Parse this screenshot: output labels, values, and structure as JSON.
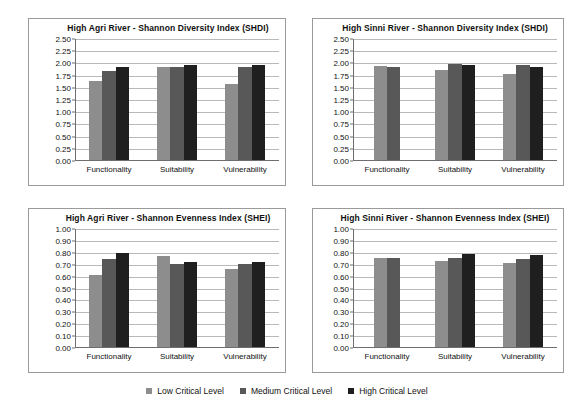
{
  "legend": {
    "items": [
      {
        "label": "Low Critical Level",
        "key": "low",
        "color": "#8d8d8d"
      },
      {
        "label": "Medium Critical Level",
        "key": "med",
        "color": "#585858"
      },
      {
        "label": "High Critical Level",
        "key": "high",
        "color": "#1f1f1f"
      }
    ]
  },
  "chart_data": [
    {
      "id": "agri-shdi",
      "type": "bar",
      "title": "High Agri River - Shannon Diversity Index (SHDI)",
      "xlabel": "",
      "ylabel": "",
      "ylim": [
        0,
        2.5
      ],
      "ytick_step": 0.25,
      "ytick_labels": [
        "0.00",
        "0.25",
        "0.50",
        "0.75",
        "1.00",
        "1.25",
        "1.50",
        "1.75",
        "2.00",
        "2.25",
        "2.50"
      ],
      "grid": true,
      "legend_position": "bottom-shared",
      "categories": [
        "Functionality",
        "Suitability",
        "Vulnerability"
      ],
      "series": [
        {
          "name": "Low Critical Level",
          "key": "low",
          "values": [
            1.64,
            1.92,
            1.58
          ]
        },
        {
          "name": "Medium Critical Level",
          "key": "med",
          "values": [
            1.84,
            1.92,
            1.92
          ]
        },
        {
          "name": "High Critical Level",
          "key": "high",
          "values": [
            1.92,
            1.97,
            1.97
          ]
        }
      ]
    },
    {
      "id": "sinni-shdi",
      "type": "bar",
      "title": "High Sinni River  -  Shannon Diversity Index (SHDI)",
      "xlabel": "",
      "ylabel": "",
      "ylim": [
        0,
        2.5
      ],
      "ytick_step": 0.25,
      "ytick_labels": [
        "0.00",
        "0.25",
        "0.50",
        "0.75",
        "1.00",
        "1.25",
        "1.50",
        "1.75",
        "2.00",
        "2.25",
        "2.50"
      ],
      "grid": true,
      "legend_position": "bottom-shared",
      "categories": [
        "Functionality",
        "Suitability",
        "Vulnerability"
      ],
      "series": [
        {
          "name": "Low Critical Level",
          "key": "low",
          "values": [
            1.95,
            1.87,
            1.78
          ]
        },
        {
          "name": "Medium Critical Level",
          "key": "med",
          "values": [
            1.93,
            1.99,
            1.97
          ]
        },
        {
          "name": "High Critical Level",
          "key": "high",
          "values": [
            null,
            1.96,
            1.93
          ]
        }
      ]
    },
    {
      "id": "agri-shei",
      "type": "bar",
      "title": "High Agri River - Shannon Evenness Index (SHEI)",
      "xlabel": "",
      "ylabel": "",
      "ylim": [
        0,
        1.0
      ],
      "ytick_step": 0.1,
      "ytick_labels": [
        "0.00",
        "0.10",
        "0.20",
        "0.30",
        "0.40",
        "0.50",
        "0.60",
        "0.70",
        "0.80",
        "0.90",
        "1.00"
      ],
      "grid": true,
      "legend_position": "bottom-shared",
      "categories": [
        "Functionality",
        "Suitability",
        "Vulnerability"
      ],
      "series": [
        {
          "name": "Low Critical Level",
          "key": "low",
          "values": [
            0.61,
            0.775,
            0.66
          ]
        },
        {
          "name": "Medium Critical Level",
          "key": "med",
          "values": [
            0.745,
            0.705,
            0.705
          ]
        },
        {
          "name": "High Critical Level",
          "key": "high",
          "values": [
            0.8,
            0.725,
            0.725
          ]
        }
      ]
    },
    {
      "id": "sinni-shei",
      "type": "bar",
      "title": "High Sinni River -  Shannon Evenness Index (SHEI)",
      "xlabel": "",
      "ylabel": "",
      "ylim": [
        0,
        1.0
      ],
      "ytick_step": 0.1,
      "ytick_labels": [
        "0.00",
        "0.10",
        "0.20",
        "0.30",
        "0.40",
        "0.50",
        "0.60",
        "0.70",
        "0.80",
        "0.90",
        "1.00"
      ],
      "grid": true,
      "legend_position": "bottom-shared",
      "categories": [
        "Functionality",
        "Suitability",
        "Vulnerability"
      ],
      "series": [
        {
          "name": "Low Critical Level",
          "key": "low",
          "values": [
            0.76,
            0.73,
            0.715
          ]
        },
        {
          "name": "Medium Critical Level",
          "key": "med",
          "values": [
            0.755,
            0.755,
            0.75
          ]
        },
        {
          "name": "High Critical Level",
          "key": "high",
          "values": [
            null,
            0.79,
            0.78
          ]
        }
      ]
    }
  ]
}
